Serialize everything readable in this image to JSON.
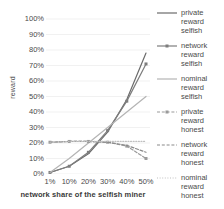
{
  "chart_data": {
    "type": "line",
    "title": "",
    "xlabel": "network share of the selfish miner",
    "ylabel": "reward",
    "categories": [
      "1%",
      "10%",
      "20%",
      "30%",
      "40%",
      "50%"
    ],
    "x": [
      1,
      10,
      20,
      30,
      40,
      50
    ],
    "ylim": [
      0,
      100
    ],
    "ytick_labels": [
      "100%",
      "90%",
      "80%",
      "70%",
      "60%",
      "50%",
      "40%",
      "30%",
      "20%",
      "10%",
      "0%"
    ],
    "ytick_values": [
      100,
      90,
      80,
      70,
      60,
      50,
      40,
      30,
      20,
      10,
      0
    ],
    "grid": true,
    "legend_position": "right",
    "series": [
      {
        "name": "private\nreward\nselfish",
        "label": "private reward selfish",
        "color": "#6b6b6b",
        "style": "solid",
        "marker": "none",
        "values": [
          1,
          5,
          13,
          27,
          48,
          78
        ]
      },
      {
        "name": "network\nreward\nselfish",
        "label": "network reward selfish",
        "color": "#7d7d7d",
        "style": "solid",
        "marker": "square",
        "values": [
          1,
          5,
          14,
          28,
          47,
          71
        ]
      },
      {
        "name": "nominal\nreward\nselfish",
        "label": "nominal reward selfish",
        "color": "#b4b4b4",
        "style": "solid",
        "marker": "none",
        "values": [
          1,
          10,
          20,
          30,
          40,
          50
        ]
      },
      {
        "name": "private\nreward\nhonest",
        "label": "private reward honest",
        "color": "#9a9a9a",
        "style": "dashed",
        "marker": "square",
        "values": [
          20.5,
          21,
          21,
          20.5,
          18,
          10
        ]
      },
      {
        "name": "network\nreward\nhonest",
        "label": "network reward honest",
        "color": "#8a8a8a",
        "style": "dashed",
        "marker": "none",
        "values": [
          20.5,
          21,
          21,
          20.5,
          18.5,
          14
        ]
      },
      {
        "name": "nominal\nreward\nhonest",
        "label": "nominal reward honest",
        "color": "#c0c0c0",
        "style": "dotted",
        "marker": "none",
        "values": [
          20.5,
          21,
          21,
          21,
          21,
          21
        ]
      }
    ]
  },
  "axes": {
    "y_label": "reward",
    "x_label": "network share of the selfish miner",
    "y_ticks": [
      "100%",
      "90%",
      "80%",
      "70%",
      "60%",
      "50%",
      "40%",
      "30%",
      "20%",
      "10%",
      "0%"
    ],
    "x_ticks": [
      "1%",
      "10%",
      "20%",
      "30%",
      "40%",
      "50%"
    ]
  },
  "legend": {
    "items": [
      {
        "label": "private\nreward\nselfish"
      },
      {
        "label": "network\nreward\nselfish"
      },
      {
        "label": "nominal\nreward\nselfish"
      },
      {
        "label": "private\nreward\nhonest"
      },
      {
        "label": "network\nreward\nhonest"
      },
      {
        "label": "nominal\nreward\nhonest"
      }
    ]
  },
  "colors": {
    "background": "#ffffff",
    "grid": "#e8e8e8",
    "text": "#4a4a4a"
  }
}
